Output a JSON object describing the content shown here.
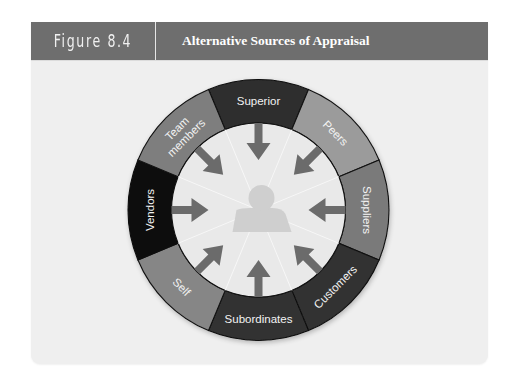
{
  "header": {
    "figure_number": "Figure 8.4",
    "title": "Alternative Sources of Appraisal"
  },
  "colors": {
    "header_bg": "#6e6e6e",
    "panel_bg": "#efefef",
    "inner_circle": "#e9e9e9",
    "arrow": "#6b6b6b",
    "silhouette": "#cfcfcf",
    "ring_stroke": "#111111",
    "label_text": "#f2f2f2"
  },
  "diagram": {
    "center_icon": "person-silhouette-icon",
    "center_x": 258.5,
    "center_y": 210,
    "outer_radius": 130.5,
    "inner_radius": 87,
    "segments": [
      {
        "label": "Superior",
        "lines": [
          "Superior"
        ],
        "angle": 0,
        "color": "#2e2e2e"
      },
      {
        "label": "Peers",
        "lines": [
          "Peers"
        ],
        "angle": 45,
        "color": "#9b9b9b"
      },
      {
        "label": "Suppliers",
        "lines": [
          "Suppliers"
        ],
        "angle": 90,
        "color": "#7a7a7a"
      },
      {
        "label": "Customers",
        "lines": [
          "Customers"
        ],
        "angle": 135,
        "color": "#303030"
      },
      {
        "label": "Subordinates",
        "lines": [
          "Subordinates"
        ],
        "angle": 180,
        "color": "#333333"
      },
      {
        "label": "Self",
        "lines": [
          "Self"
        ],
        "angle": 225,
        "color": "#868686"
      },
      {
        "label": "Vendors",
        "lines": [
          "Vendors"
        ],
        "angle": 270,
        "color": "#0e0e0e"
      },
      {
        "label": "Team members",
        "lines": [
          "Team",
          "members"
        ],
        "angle": 315,
        "color": "#7e7e7e"
      }
    ]
  }
}
